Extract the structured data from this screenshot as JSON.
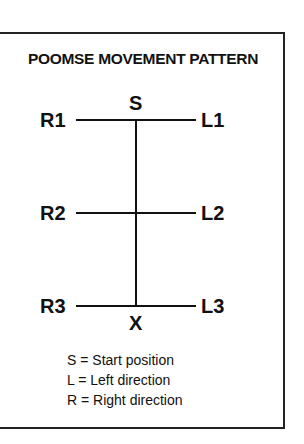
{
  "title": "POOMSE MOVEMENT PATTERN",
  "nodes": {
    "start": "S",
    "end": "X",
    "r1": "R1",
    "r2": "R2",
    "r3": "R3",
    "l1": "L1",
    "l2": "L2",
    "l3": "L3"
  },
  "legend": [
    "S = Start position",
    "L = Left direction",
    "R = Right direction"
  ]
}
